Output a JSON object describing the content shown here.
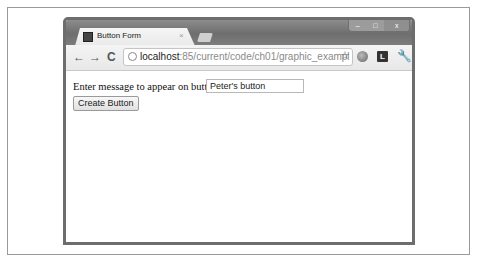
{
  "browser": {
    "tab": {
      "title": "Button Form",
      "close_glyph": "×"
    },
    "window_controls": {
      "minimize": "–",
      "maximize": "□",
      "close": "x"
    },
    "nav": {
      "back": "←",
      "forward": "→",
      "reload": "C"
    },
    "address_bar": {
      "host": "localhost",
      "path": ":85/current/code/ch01/graphic_exampl"
    },
    "toolbar_icons": {
      "star": "☆",
      "extension_label": "L",
      "wrench": "🔧"
    }
  },
  "page": {
    "label": "Enter message to appear on button:",
    "message_input": {
      "value": "Peter's button"
    },
    "create_button": "Create Button"
  }
}
